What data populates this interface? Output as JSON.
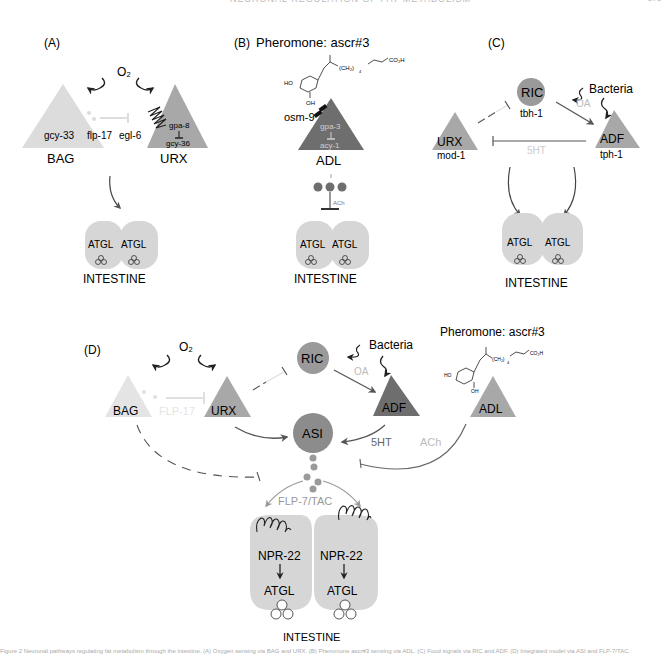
{
  "header": {
    "running_title": "NEURONAL REGULATION OF FAT METABOLISM",
    "page_number": "275"
  },
  "panels": {
    "A": {
      "label": "(A)",
      "stimulus": "O₂",
      "neurons": [
        {
          "name": "BAG",
          "gene": "gcy-33",
          "color": "#dcdcdc"
        },
        {
          "name": "URX",
          "genes": [
            "gpa-8",
            "gcy-36"
          ],
          "color": "#a8a8a8"
        }
      ],
      "signal": "flp-17",
      "receptor": "egl-6",
      "target": {
        "organ": "INTESTINE",
        "cells": [
          "ATGL",
          "ATGL"
        ]
      }
    },
    "B": {
      "label": "(B)",
      "title": "Pheromone: ascr#3",
      "chem": {
        "oh1": "HO",
        "oh2": "OH",
        "chain": "(CH₂)",
        "sub": "4",
        "acid": "CO₂H"
      },
      "neuron": {
        "name": "ADL",
        "genes": [
          "gpa-3",
          "acy-1"
        ],
        "channel": "osm-9",
        "color": "#6e6e6e"
      },
      "transmitter": "ACh",
      "target": {
        "organ": "INTESTINE",
        "cells": [
          "ATGL",
          "ATGL"
        ]
      }
    },
    "C": {
      "label": "(C)",
      "stimulus": "Bacteria",
      "neurons": [
        {
          "name": "RIC",
          "gene": "tbh-1",
          "color": "#9a9a9a"
        },
        {
          "name": "URX",
          "gene": "mod-1",
          "color": "#a8a8a8"
        },
        {
          "name": "ADF",
          "gene": "tph-1",
          "color": "#a8a8a8"
        }
      ],
      "signals": [
        "OA",
        "5HT"
      ],
      "target": {
        "organ": "INTESTINE",
        "cells": [
          "ATGL",
          "ATGL"
        ]
      }
    },
    "D": {
      "label": "(D)",
      "stimulus_o2": "O₂",
      "stimulus_bacteria": "Bacteria",
      "pheromone_title": "Pheromone: ascr#3",
      "chem": {
        "oh1": "HO",
        "oh2": "OH",
        "chain": "(CH₂)",
        "sub": "4",
        "acid": "CO₂H"
      },
      "neurons": {
        "BAG": "BAG",
        "URX": "URX",
        "RIC": "RIC",
        "ADF": "ADF",
        "ADL": "ADL",
        "ASI": "ASI"
      },
      "signals": {
        "flp17": "FLP-17",
        "oa": "OA",
        "ht": "5HT",
        "ach": "ACh",
        "flp7": "FLP-7/TAC"
      },
      "target": {
        "organ": "INTESTINE",
        "cells": [
          {
            "receptor": "NPR-22",
            "effector": "ATGL"
          },
          {
            "receptor": "NPR-22",
            "effector": "ATGL"
          }
        ]
      }
    }
  },
  "caption": "Figure 2 Neuronal pathways regulating fat metabolism through the intestine. (A) Oxygen sensing via BAG and URX. (B) Pheromone ascr#3 sensing via ADL. (C) Food signals via RIC and ADF. (D) Integrated model via ASI and FLP-7/TAC."
}
